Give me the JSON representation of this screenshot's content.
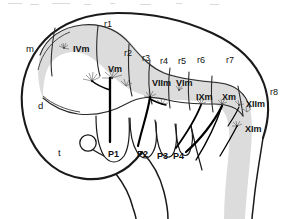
{
  "figure": {
    "background_color": "#ffffff",
    "outline_color": "#1a1a1a",
    "segment_fill_color": "#d8d8d8",
    "segment_line_color": "#2b2b2b",
    "nucleus_color": "#4a4a4a",
    "axon_color": "#000000"
  },
  "brain_regions": [
    {
      "id": "m",
      "label": "m",
      "x": 26,
      "y": 44
    },
    {
      "id": "d",
      "label": "d",
      "x": 38,
      "y": 101
    },
    {
      "id": "t",
      "label": "t",
      "x": 58,
      "y": 148
    }
  ],
  "rhombomeres": [
    {
      "id": "r1",
      "label": "r1",
      "x": 104,
      "y": 20
    },
    {
      "id": "r2",
      "label": "r2",
      "x": 124,
      "y": 49
    },
    {
      "id": "r3",
      "label": "r3",
      "x": 142,
      "y": 54
    },
    {
      "id": "r4",
      "label": "r4",
      "x": 160,
      "y": 57
    },
    {
      "id": "r5",
      "label": "r5",
      "x": 178,
      "y": 57
    },
    {
      "id": "r6",
      "label": "r6",
      "x": 197,
      "y": 56
    },
    {
      "id": "r7",
      "label": "r7",
      "x": 226,
      "y": 56
    },
    {
      "id": "r8",
      "label": "r8",
      "x": 270,
      "y": 88
    }
  ],
  "motor_nuclei": [
    {
      "id": "IVm",
      "label": "IVm",
      "x": 73,
      "y": 45,
      "marker_x": 64,
      "marker_y": 47
    },
    {
      "id": "Vm",
      "label": "Vm",
      "x": 108,
      "y": 65,
      "marker_x": 110,
      "marker_y": 80
    },
    {
      "id": "VIIm",
      "label": "VIIm",
      "x": 152,
      "y": 79,
      "marker_x": 152,
      "marker_y": 98
    },
    {
      "id": "VIm",
      "label": "VIm",
      "x": 176,
      "y": 79,
      "marker_x": 180,
      "marker_y": 90
    },
    {
      "id": "IXm",
      "label": "IXm",
      "x": 196,
      "y": 93,
      "marker_x": 201,
      "marker_y": 105
    },
    {
      "id": "Xm",
      "label": "Xm",
      "x": 222,
      "y": 93,
      "marker_x": 222,
      "marker_y": 105
    },
    {
      "id": "XIIm",
      "label": "XIIm",
      "x": 246,
      "y": 100,
      "marker_x": 240,
      "marker_y": 104
    },
    {
      "id": "XIm",
      "label": "XIm",
      "x": 245,
      "y": 125,
      "marker_x": 238,
      "marker_y": 126
    }
  ],
  "pharyngeal_arches": [
    {
      "id": "P1",
      "label": "P1",
      "x": 108,
      "y": 150
    },
    {
      "id": "P2",
      "label": "P2",
      "x": 137,
      "y": 150
    },
    {
      "id": "P3",
      "label": "P3",
      "x": 157,
      "y": 152
    },
    {
      "id": "P4",
      "label": "P4",
      "x": 173,
      "y": 152
    }
  ]
}
